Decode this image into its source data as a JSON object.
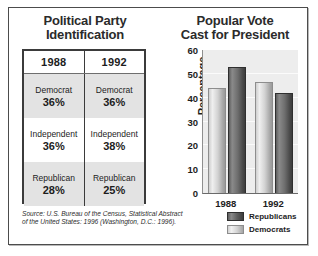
{
  "figure": {
    "border_color": "#4c4c4c",
    "background": "#ffffff"
  },
  "left_panel": {
    "title_line1": "Political Party",
    "title_line2": "Identification",
    "table": {
      "columns": [
        "1988",
        "1992"
      ],
      "rows": [
        {
          "shaded": true,
          "cells": [
            {
              "name": "Democrat",
              "pct": "36%"
            },
            {
              "name": "Democrat",
              "pct": "36%"
            }
          ]
        },
        {
          "shaded": false,
          "cells": [
            {
              "name": "Independent",
              "pct": "36%"
            },
            {
              "name": "Independent",
              "pct": "38%"
            }
          ]
        },
        {
          "shaded": true,
          "cells": [
            {
              "name": "Republican",
              "pct": "28%"
            },
            {
              "name": "Republican",
              "pct": "25%"
            }
          ]
        }
      ]
    }
  },
  "source_note": {
    "line1": "Source: U.S. Bureau of the Census, Statistical Abstract",
    "line2": "of the United States: 1996 (Washington, D.C.: 1996)."
  },
  "right_panel": {
    "title_line1": "Popular Vote",
    "title_line2": "Cast for President"
  },
  "chart_data": {
    "type": "bar",
    "title": "Popular Vote Cast for President",
    "xlabel": "",
    "ylabel": "Percentage",
    "ylim": [
      0,
      60
    ],
    "yticks": [
      0,
      10,
      20,
      30,
      40,
      50,
      60
    ],
    "ytick_labels": [
      "0",
      "10",
      "20",
      "30",
      "40",
      "50",
      "60"
    ],
    "grid": true,
    "legend_position": "below-right",
    "categories": [
      "1988",
      "1992"
    ],
    "series": [
      {
        "name": "Democrats",
        "color": "#d2d2d2",
        "values": [
          44,
          46.5
        ]
      },
      {
        "name": "Republicans",
        "color": "#5e5e5e",
        "values": [
          53,
          42
        ]
      }
    ],
    "bar_order_within_group": [
      "Democrats",
      "Republicans"
    ]
  }
}
